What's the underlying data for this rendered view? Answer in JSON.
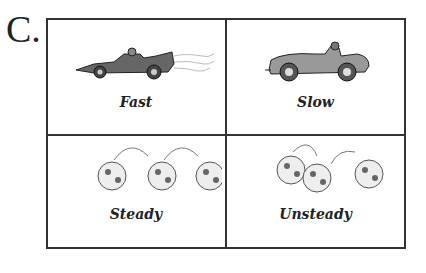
{
  "figure_label": "C.",
  "cells": [
    {
      "caption": "Fast",
      "icon": "race-car-icon"
    },
    {
      "caption": "Slow",
      "icon": "vintage-car-icon"
    },
    {
      "caption": "Steady",
      "icon": "soccer-balls-even-icon"
    },
    {
      "caption": "Unsteady",
      "icon": "soccer-balls-uneven-icon"
    }
  ]
}
